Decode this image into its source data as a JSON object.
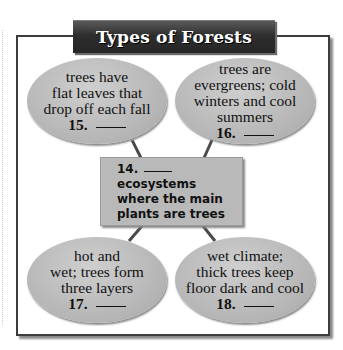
{
  "title": "Types of Forests",
  "center": {
    "number": "14.",
    "lines": [
      "ecosystems",
      "where the main",
      "plants are trees"
    ]
  },
  "nodes": [
    {
      "number": "15.",
      "lines": [
        "trees have",
        "flat leaves that",
        "drop off each fall"
      ]
    },
    {
      "number": "16.",
      "lines": [
        "trees are",
        "evergreens; cold",
        "winters and cool",
        "summers"
      ]
    },
    {
      "number": "17.",
      "lines": [
        "hot and",
        "wet; trees form",
        "three layers"
      ]
    },
    {
      "number": "18.",
      "lines": [
        "wet climate;",
        "thick trees keep",
        "floor dark and cool"
      ]
    }
  ],
  "colors": {
    "banner": "#2e2e2e",
    "frame": "#3c3c3c",
    "bubble": "#b4b4b4",
    "center_box": "#b9b9b9",
    "connector": "#4a4a4a"
  }
}
